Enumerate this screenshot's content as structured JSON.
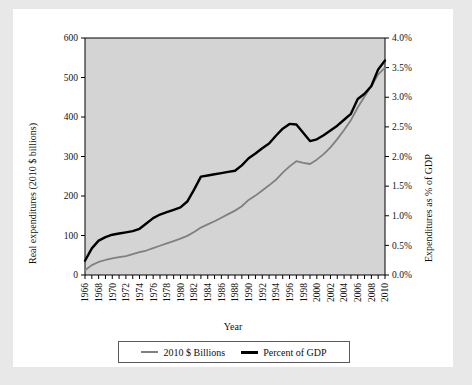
{
  "figure": {
    "background": "#e8e8e8",
    "card_background": "#ffffff",
    "plot_background": "#d4d4d4"
  },
  "chart_data": {
    "type": "line",
    "title": "",
    "xlabel": "Year",
    "ylabel": "Real expenditures (2010 $ billions)",
    "ylabel_right": "Expenditures as % of GDP",
    "grid": false,
    "legend_position": "bottom",
    "xlim": [
      1966,
      2010
    ],
    "ylim": [
      0,
      600
    ],
    "ylim_right": [
      0.0,
      4.0
    ],
    "ytick_labels": [
      "0",
      "100",
      "200",
      "300",
      "400",
      "500",
      "600"
    ],
    "ytick_values": [
      0,
      100,
      200,
      300,
      400,
      500,
      600
    ],
    "ytick_right_labels": [
      "0.0%",
      "0.5%",
      "1.0%",
      "1.5%",
      "2.0%",
      "2.5%",
      "3.0%",
      "3.5%",
      "4.0%"
    ],
    "ytick_right_values": [
      0.0,
      0.5,
      1.0,
      1.5,
      2.0,
      2.5,
      3.0,
      3.5,
      4.0
    ],
    "xtick_labels": [
      "1966",
      "1968",
      "1970",
      "1972",
      "1974",
      "1976",
      "1978",
      "1980",
      "1982",
      "1984",
      "1986",
      "1988",
      "1990",
      "1992",
      "1994",
      "1996",
      "1998",
      "2000",
      "2002",
      "2004",
      "2006",
      "2008",
      "2010"
    ],
    "x": [
      1966,
      1967,
      1968,
      1969,
      1970,
      1971,
      1972,
      1973,
      1974,
      1975,
      1976,
      1977,
      1978,
      1979,
      1980,
      1981,
      1982,
      1983,
      1984,
      1985,
      1986,
      1987,
      1988,
      1989,
      1990,
      1991,
      1992,
      1993,
      1994,
      1995,
      1996,
      1997,
      1998,
      1999,
      2000,
      2001,
      2002,
      2003,
      2004,
      2005,
      2006,
      2007,
      2008,
      2009,
      2010
    ],
    "series": [
      {
        "name": "2010 $ Billions",
        "color": "#808080",
        "axis": "left",
        "values": [
          12,
          25,
          33,
          38,
          42,
          45,
          48,
          53,
          58,
          62,
          68,
          74,
          80,
          86,
          92,
          99,
          109,
          120,
          128,
          136,
          145,
          154,
          163,
          174,
          190,
          201,
          214,
          227,
          241,
          259,
          275,
          288,
          284,
          281,
          292,
          306,
          323,
          344,
          367,
          392,
          424,
          452,
          478,
          508,
          525
        ]
      },
      {
        "name": "Percent of GDP",
        "color": "#000000",
        "axis": "right",
        "values": [
          0.24,
          0.45,
          0.58,
          0.64,
          0.68,
          0.7,
          0.72,
          0.74,
          0.78,
          0.87,
          0.96,
          1.02,
          1.06,
          1.1,
          1.14,
          1.24,
          1.44,
          1.66,
          1.68,
          1.7,
          1.72,
          1.74,
          1.76,
          1.85,
          1.97,
          2.05,
          2.14,
          2.22,
          2.35,
          2.47,
          2.55,
          2.54,
          2.4,
          2.26,
          2.29,
          2.36,
          2.44,
          2.52,
          2.62,
          2.72,
          2.97,
          3.06,
          3.19,
          3.47,
          3.62
        ]
      }
    ]
  }
}
